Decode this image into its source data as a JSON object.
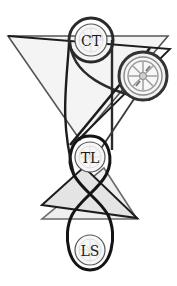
{
  "diagram": {
    "title": "",
    "canvas": {
      "width": 177,
      "height": 286,
      "background": "#ffffff"
    },
    "colors": {
      "stroke_dark": "#1c1c1c",
      "stroke_mid": "#3a3a3a",
      "stroke_gray": "#6a6a6a",
      "fill_light": "#e6e6e6",
      "fill_lighter": "#efefef",
      "circle_fill": "#f6f6f6",
      "spoke_gray": "#b8b8b8"
    },
    "nodes": [
      {
        "id": "ct",
        "label": "CT",
        "cx": 91,
        "cy": 40,
        "r_inner": 16,
        "r_ring": 21,
        "icon": "wheel-faint-icon"
      },
      {
        "id": "wheel",
        "label": "",
        "cx": 143,
        "cy": 76,
        "r_inner": 19,
        "r_ring": 24,
        "icon": "wheel-icon"
      },
      {
        "id": "tl",
        "label": "TL",
        "cx": 90,
        "cy": 157,
        "r_inner": 15,
        "r_ring": 0,
        "icon": "wheel-faint-icon"
      },
      {
        "id": "ls",
        "label": "LS",
        "cx": 90,
        "cy": 250,
        "r_inner": 15,
        "r_ring": 0,
        "icon": "wheel-faint-icon"
      }
    ],
    "shapes": {
      "top_triangle": {
        "label": "",
        "points": "8,36 168,36 80,140"
      },
      "top_triangle_offset": {
        "label": "",
        "points": "10,36 170,49 78,140"
      },
      "lower_triangle_front": {
        "label": "",
        "points": "42,205 84,167 137,218"
      },
      "lower_triangle_back": {
        "label": "",
        "points": "42,219 137,219 104,168"
      }
    },
    "connectors": [
      {
        "id": "ct-loop-to-tl",
        "label": ""
      },
      {
        "id": "tl-ls-figure-eight",
        "label": ""
      },
      {
        "id": "ct-to-wheel-belt",
        "label": ""
      },
      {
        "id": "wheel-to-tl-diagonal",
        "label": ""
      }
    ]
  }
}
